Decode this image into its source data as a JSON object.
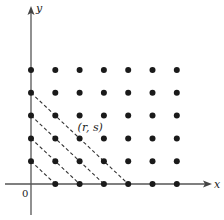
{
  "diagram": {
    "title": "",
    "axes": {
      "x_label": "x",
      "y_label": "y",
      "origin_label": "0"
    },
    "lattice": {
      "x_range": [
        0,
        6
      ],
      "y_range": [
        0,
        5
      ],
      "exclude_origin": true,
      "description": "Lattice points (m, n) with m, n nonnegative integers"
    },
    "diagonals": [
      {
        "from": [
          0,
          1
        ],
        "to": [
          1,
          0
        ]
      },
      {
        "from": [
          0,
          2
        ],
        "to": [
          2,
          0
        ]
      },
      {
        "from": [
          0,
          3
        ],
        "to": [
          3,
          0
        ]
      },
      {
        "from": [
          0,
          4
        ],
        "to": [
          4,
          0
        ]
      }
    ],
    "annotation": {
      "text": "(r, s)",
      "near_point": [
        2,
        2
      ]
    }
  }
}
